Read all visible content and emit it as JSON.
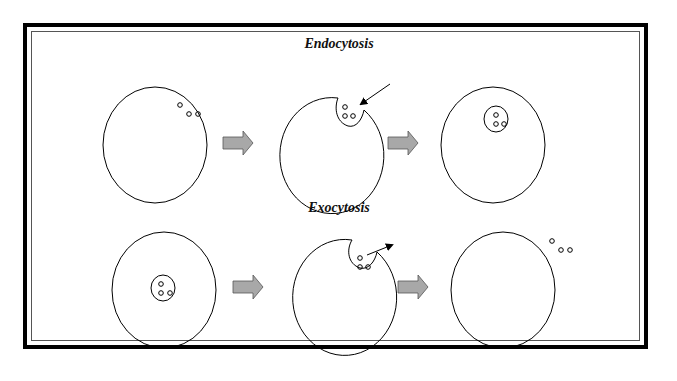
{
  "diagram": {
    "type": "process",
    "rows": [
      {
        "title": "Endocytosis",
        "steps": [
          {
            "stage": 1,
            "description": "Cell with particles outside"
          },
          {
            "stage": 2,
            "description": "Membrane invaginates around particles (arrow pointing in)"
          },
          {
            "stage": 3,
            "description": "Vesicle with particles inside cell"
          }
        ]
      },
      {
        "title": "Exocytosis",
        "steps": [
          {
            "stage": 1,
            "description": "Vesicle with particles inside cell"
          },
          {
            "stage": 2,
            "description": "Vesicle fuses with membrane, particles released (arrow pointing out)"
          },
          {
            "stage": 3,
            "description": "Cell with particles outside"
          }
        ]
      }
    ],
    "colors": {
      "border": "#000000",
      "stroke": "#000000",
      "process_arrow_fill": "#a8a8a8",
      "process_arrow_stroke": "#555555",
      "background": "#ffffff"
    }
  }
}
